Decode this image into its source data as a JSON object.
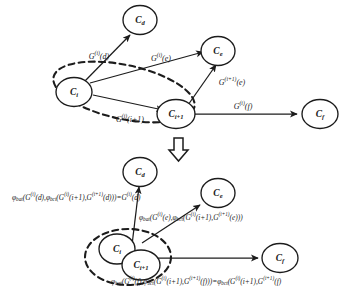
{
  "figure": {
    "background_color": "#ffffff",
    "ink_color": "#1c1c1c",
    "transform_arrow": "hollow-down-arrow"
  },
  "top_diagram": {
    "nodes": [
      {
        "id": "Cd",
        "base": "C",
        "sub": "d"
      },
      {
        "id": "Ce",
        "base": "C",
        "sub": "e"
      },
      {
        "id": "Ci",
        "base": "C",
        "sub": "i"
      },
      {
        "id": "Ci1",
        "base": "C",
        "sub": "i+1"
      },
      {
        "id": "Cf",
        "base": "C",
        "sub": "f"
      }
    ],
    "edges": [
      {
        "from": "Ci",
        "to": "Cd",
        "base": "G",
        "sup": "(i)",
        "arg": "(d)"
      },
      {
        "from": "Ci",
        "to": "Ce",
        "base": "G",
        "sup": "(i)",
        "arg": "(e)"
      },
      {
        "from": "Ci",
        "to": "Ci1",
        "base": "G",
        "sup": "(i)",
        "arg": "(i+1)"
      },
      {
        "from": "Ci1",
        "to": "Ce",
        "base": "G",
        "sup": "(i+1)",
        "arg": "(e)"
      },
      {
        "from": "Ci1",
        "to": "Cf",
        "base": "G",
        "sup": "(i)",
        "arg": "(f)"
      }
    ],
    "grouping": "dashed-ellipse-around-Ci-and-Ci1"
  },
  "bottom_diagram": {
    "nodes": [
      {
        "id": "Cd",
        "base": "C",
        "sub": "d"
      },
      {
        "id": "Ce",
        "base": "C",
        "sub": "e"
      },
      {
        "id": "Ci",
        "base": "C",
        "sub": "i"
      },
      {
        "id": "Ci1",
        "base": "C",
        "sub": "i+1"
      },
      {
        "id": "Cf",
        "base": "C",
        "sub": "f"
      }
    ],
    "grouping": "dashed-ellipse-around-merged-Ci-Ci1",
    "edges": [
      {
        "from": "merged",
        "to": "Cd"
      },
      {
        "from": "merged",
        "to": "Ce"
      },
      {
        "from": "merged",
        "to": "Cf"
      }
    ]
  },
  "formulas": {
    "to_d": {
      "phi1": "φ",
      "phi1_sub": "bat",
      "phi2": "φ",
      "phi2_sub": "bct",
      "text_plain": "φbat(G(i)(d),φbct(G(i)(i+1),G(i+1)(d)))=G(i)(d)",
      "parts": [
        {
          "t": "φ",
          "k": "phi"
        },
        {
          "t": "bat",
          "k": "sub"
        },
        {
          "t": "(",
          "k": "n"
        },
        {
          "t": "G",
          "k": "n"
        },
        {
          "t": "(i)",
          "k": "sup"
        },
        {
          "t": "(d),",
          "k": "n"
        },
        {
          "t": "φ",
          "k": "phi"
        },
        {
          "t": "bct",
          "k": "sub"
        },
        {
          "t": "(",
          "k": "n"
        },
        {
          "t": "G",
          "k": "n"
        },
        {
          "t": "(i)",
          "k": "sup"
        },
        {
          "t": "(i+1),",
          "k": "n"
        },
        {
          "t": "G",
          "k": "n"
        },
        {
          "t": "(i+1)",
          "k": "sup"
        },
        {
          "t": "(d)))=",
          "k": "n"
        },
        {
          "t": "G",
          "k": "n"
        },
        {
          "t": "(i)",
          "k": "sup"
        },
        {
          "t": "(d)",
          "k": "n"
        }
      ]
    },
    "to_e": {
      "text_plain": "φbat(G(i)(e),φbct(G(i)(i+1),G(i+1)(e)))",
      "parts": [
        {
          "t": "φ",
          "k": "phi"
        },
        {
          "t": "bat",
          "k": "sub"
        },
        {
          "t": "(",
          "k": "n"
        },
        {
          "t": "G",
          "k": "n"
        },
        {
          "t": "(i)",
          "k": "sup"
        },
        {
          "t": "(e),",
          "k": "n"
        },
        {
          "t": "φ",
          "k": "phi"
        },
        {
          "t": "bct",
          "k": "sub"
        },
        {
          "t": "(",
          "k": "n"
        },
        {
          "t": "G",
          "k": "n"
        },
        {
          "t": "(i)",
          "k": "sup"
        },
        {
          "t": "(i+1),",
          "k": "n"
        },
        {
          "t": "G",
          "k": "n"
        },
        {
          "t": "(i+1)",
          "k": "sup"
        },
        {
          "t": "(e)))",
          "k": "n"
        }
      ]
    },
    "to_f": {
      "text_plain": "φbat(G(i)(f),φbct(G(i)(i+1),G(i+1)(f)))=φbct(G(i)(i+1),G(i+1)(f))",
      "parts": [
        {
          "t": "φ",
          "k": "phi"
        },
        {
          "t": "bat",
          "k": "sub"
        },
        {
          "t": "(",
          "k": "n"
        },
        {
          "t": "G",
          "k": "n"
        },
        {
          "t": "(i)",
          "k": "sup"
        },
        {
          "t": "(f),",
          "k": "n"
        },
        {
          "t": "φ",
          "k": "phi"
        },
        {
          "t": "bct",
          "k": "sub"
        },
        {
          "t": "(",
          "k": "n"
        },
        {
          "t": "G",
          "k": "n"
        },
        {
          "t": "(i)",
          "k": "sup"
        },
        {
          "t": "(i+1),",
          "k": "n"
        },
        {
          "t": "G",
          "k": "n"
        },
        {
          "t": "(i+1)",
          "k": "sup"
        },
        {
          "t": "(f)))=",
          "k": "n"
        },
        {
          "t": "φ",
          "k": "phi"
        },
        {
          "t": "bct",
          "k": "sub"
        },
        {
          "t": "(",
          "k": "n"
        },
        {
          "t": "G",
          "k": "n"
        },
        {
          "t": "(i)",
          "k": "sup"
        },
        {
          "t": "(i+1),",
          "k": "n"
        },
        {
          "t": "G",
          "k": "n"
        },
        {
          "t": "(i+1)",
          "k": "sup"
        },
        {
          "t": "(f)",
          "k": "n"
        }
      ]
    }
  }
}
